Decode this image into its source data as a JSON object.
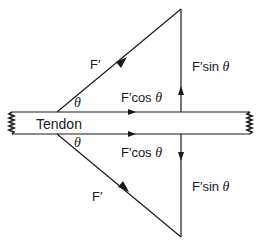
{
  "diagram": {
    "labels": {
      "tendon": "Tendon",
      "force_upper": "F′",
      "force_lower": "F′",
      "theta_upper": "θ",
      "theta_lower": "θ",
      "cos_upper_prefix": "F′cos ",
      "cos_upper_theta": "θ",
      "cos_lower_prefix": "F′cos ",
      "cos_lower_theta": "θ",
      "sin_upper_prefix": "F′sin ",
      "sin_upper_theta": "θ",
      "sin_lower_prefix": "F′sin ",
      "sin_lower_theta": "θ"
    },
    "colors": {
      "line": "#1a1a1a",
      "background": "#ffffff"
    }
  }
}
